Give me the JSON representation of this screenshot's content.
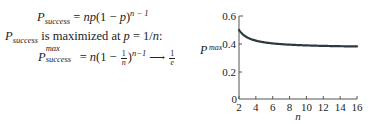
{
  "equations": {
    "line1": {
      "lhs_symbol": "P",
      "lhs_subscript": "success",
      "rhs_prefix": "= ",
      "rhs_np": "np",
      "rhs_paren": "(1 − ",
      "rhs_p": "p",
      "rhs_close": ")",
      "rhs_exponent": "n − 1"
    },
    "line2": {
      "symbol": "P",
      "subscript": "success",
      "text": " is maximized at ",
      "var": "p",
      "value": " = 1/",
      "n": "n",
      "colon": ":"
    },
    "line3": {
      "symbol": "P",
      "superscript": "max",
      "subscript": "success",
      "eq": "= ",
      "n": "n",
      "open": "(1 − ",
      "frac_num": "1",
      "frac_den": "n",
      "close": ")",
      "exponent": "n−1",
      "arrow": "⟶",
      "limit_num": "1",
      "limit_den": "e"
    }
  },
  "chart_data": {
    "type": "line",
    "title": "",
    "xlabel": "n",
    "ylabel": "P^max",
    "ylabel_symbol": "P",
    "ylabel_superscript": "max",
    "xlim": [
      2,
      16
    ],
    "ylim": [
      0,
      0.6
    ],
    "x_ticks": [
      "2",
      "4",
      "6",
      "8",
      "10",
      "12",
      "14",
      "16"
    ],
    "y_ticks": [
      "0",
      "0.2",
      "0.4",
      "0.6"
    ],
    "grid": false,
    "legend": null,
    "series": [
      {
        "name": "P_max = (1 - 1/n)^(n-1)",
        "x": [
          2,
          3,
          4,
          5,
          6,
          7,
          8,
          9,
          10,
          11,
          12,
          13,
          14,
          15,
          16
        ],
        "y": [
          0.5,
          0.444,
          0.422,
          0.41,
          0.402,
          0.397,
          0.393,
          0.39,
          0.387,
          0.385,
          0.384,
          0.382,
          0.381,
          0.381,
          0.38
        ],
        "color": "#2a3a40"
      }
    ]
  }
}
